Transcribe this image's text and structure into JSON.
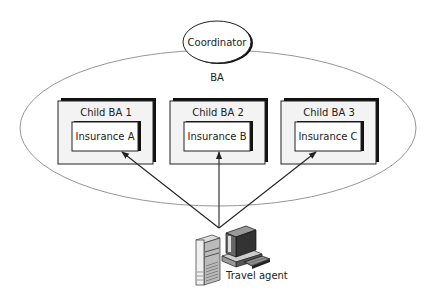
{
  "diagram": {
    "coordinator": {
      "label": "Coordinator"
    },
    "outer_activity": {
      "label": "BA"
    },
    "children": [
      {
        "label": "Child BA 1",
        "participant": "Insurance A"
      },
      {
        "label": "Child BA 2",
        "participant": "Insurance B"
      },
      {
        "label": "Child BA 3",
        "participant": "Insurance C"
      }
    ],
    "client": {
      "label": "Travel agent",
      "icon": "computer-workstation-icon"
    },
    "edges": [
      {
        "from": "Travel agent",
        "to": "Insurance A",
        "type": "arrow"
      },
      {
        "from": "Travel agent",
        "to": "Insurance B",
        "type": "arrow"
      },
      {
        "from": "Travel agent",
        "to": "Insurance C",
        "type": "arrow"
      }
    ],
    "colors": {
      "line": "#222222",
      "ellipse": "#8a8a8a",
      "child_fill": "#f3f3f3",
      "box_fill": "#ffffff"
    }
  }
}
